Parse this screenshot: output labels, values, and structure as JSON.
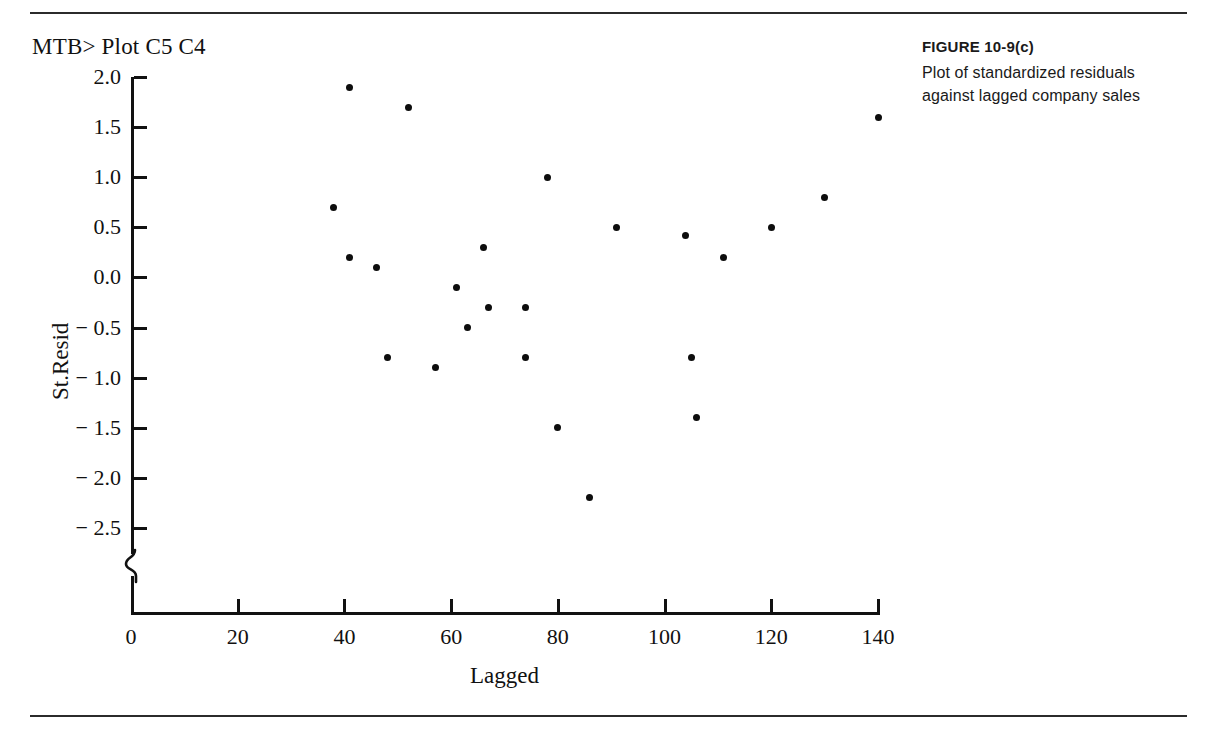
{
  "page": {
    "rule_color": "#2b2b2b",
    "background": "#ffffff"
  },
  "terminal": {
    "command": "MTB> Plot C5 C4"
  },
  "caption": {
    "figure_number": "FIGURE  10-9(c)",
    "line1": "Plot of standardized residuals",
    "line2": "against lagged company sales"
  },
  "chart_data": {
    "type": "scatter",
    "title": "",
    "xlabel": "Lagged",
    "ylabel": "St.Resid",
    "xlim": [
      0,
      140
    ],
    "ylim": [
      -2.75,
      2.0
    ],
    "xticks": [
      0,
      20,
      40,
      60,
      80,
      100,
      120,
      140
    ],
    "xtick_labels": [
      "0",
      "20",
      "40",
      "60",
      "80",
      "100",
      "120",
      "140"
    ],
    "yticks": [
      2.0,
      1.5,
      1.0,
      0.5,
      0.0,
      -0.5,
      -1.0,
      -1.5,
      -2.0,
      -2.5
    ],
    "ytick_labels": [
      "2.0",
      "1.5",
      "1.0",
      "0.5",
      "0.0",
      "− 0.5",
      "− 1.0",
      "− 1.5",
      "− 2.0",
      "− 2.5"
    ],
    "grid": false,
    "legend": false,
    "axis_break_y": true,
    "marker": "filled-circle",
    "marker_color": "#0d0d0d",
    "x": [
      38,
      41,
      41,
      46,
      48,
      52,
      57,
      61,
      63,
      63,
      66,
      69,
      74,
      75,
      78,
      81,
      86,
      91,
      104,
      105,
      106,
      111,
      120,
      130,
      140
    ],
    "y": [
      0.7,
      1.9,
      0.2,
      0.1,
      -0.8,
      1.7,
      -0.9,
      -0.1,
      -0.5,
      -0.3,
      0.3,
      -0.3,
      -0.8,
      -0.3,
      1.0,
      -1.5,
      -2.2,
      0.5,
      0.42,
      -0.8,
      -1.4,
      0.2,
      0.5,
      0.8,
      1.6
    ],
    "points": [
      {
        "x": 38,
        "y": 0.7
      },
      {
        "x": 41,
        "y": 1.9
      },
      {
        "x": 41,
        "y": 0.2
      },
      {
        "x": 46,
        "y": 0.1
      },
      {
        "x": 48,
        "y": -0.8
      },
      {
        "x": 52,
        "y": 1.7
      },
      {
        "x": 57,
        "y": -0.9
      },
      {
        "x": 61,
        "y": -0.1
      },
      {
        "x": 63,
        "y": -0.5
      },
      {
        "x": 66,
        "y": 0.3
      },
      {
        "x": 67,
        "y": -0.3
      },
      {
        "x": 74,
        "y": -0.3
      },
      {
        "x": 74,
        "y": -0.8
      },
      {
        "x": 78,
        "y": 1.0
      },
      {
        "x": 80,
        "y": -1.5
      },
      {
        "x": 86,
        "y": -2.2
      },
      {
        "x": 91,
        "y": 0.5
      },
      {
        "x": 104,
        "y": 0.42
      },
      {
        "x": 105,
        "y": -0.8
      },
      {
        "x": 106,
        "y": -1.4
      },
      {
        "x": 111,
        "y": 0.2
      },
      {
        "x": 120,
        "y": 0.5
      },
      {
        "x": 130,
        "y": 0.8
      },
      {
        "x": 140,
        "y": 1.6
      }
    ]
  }
}
